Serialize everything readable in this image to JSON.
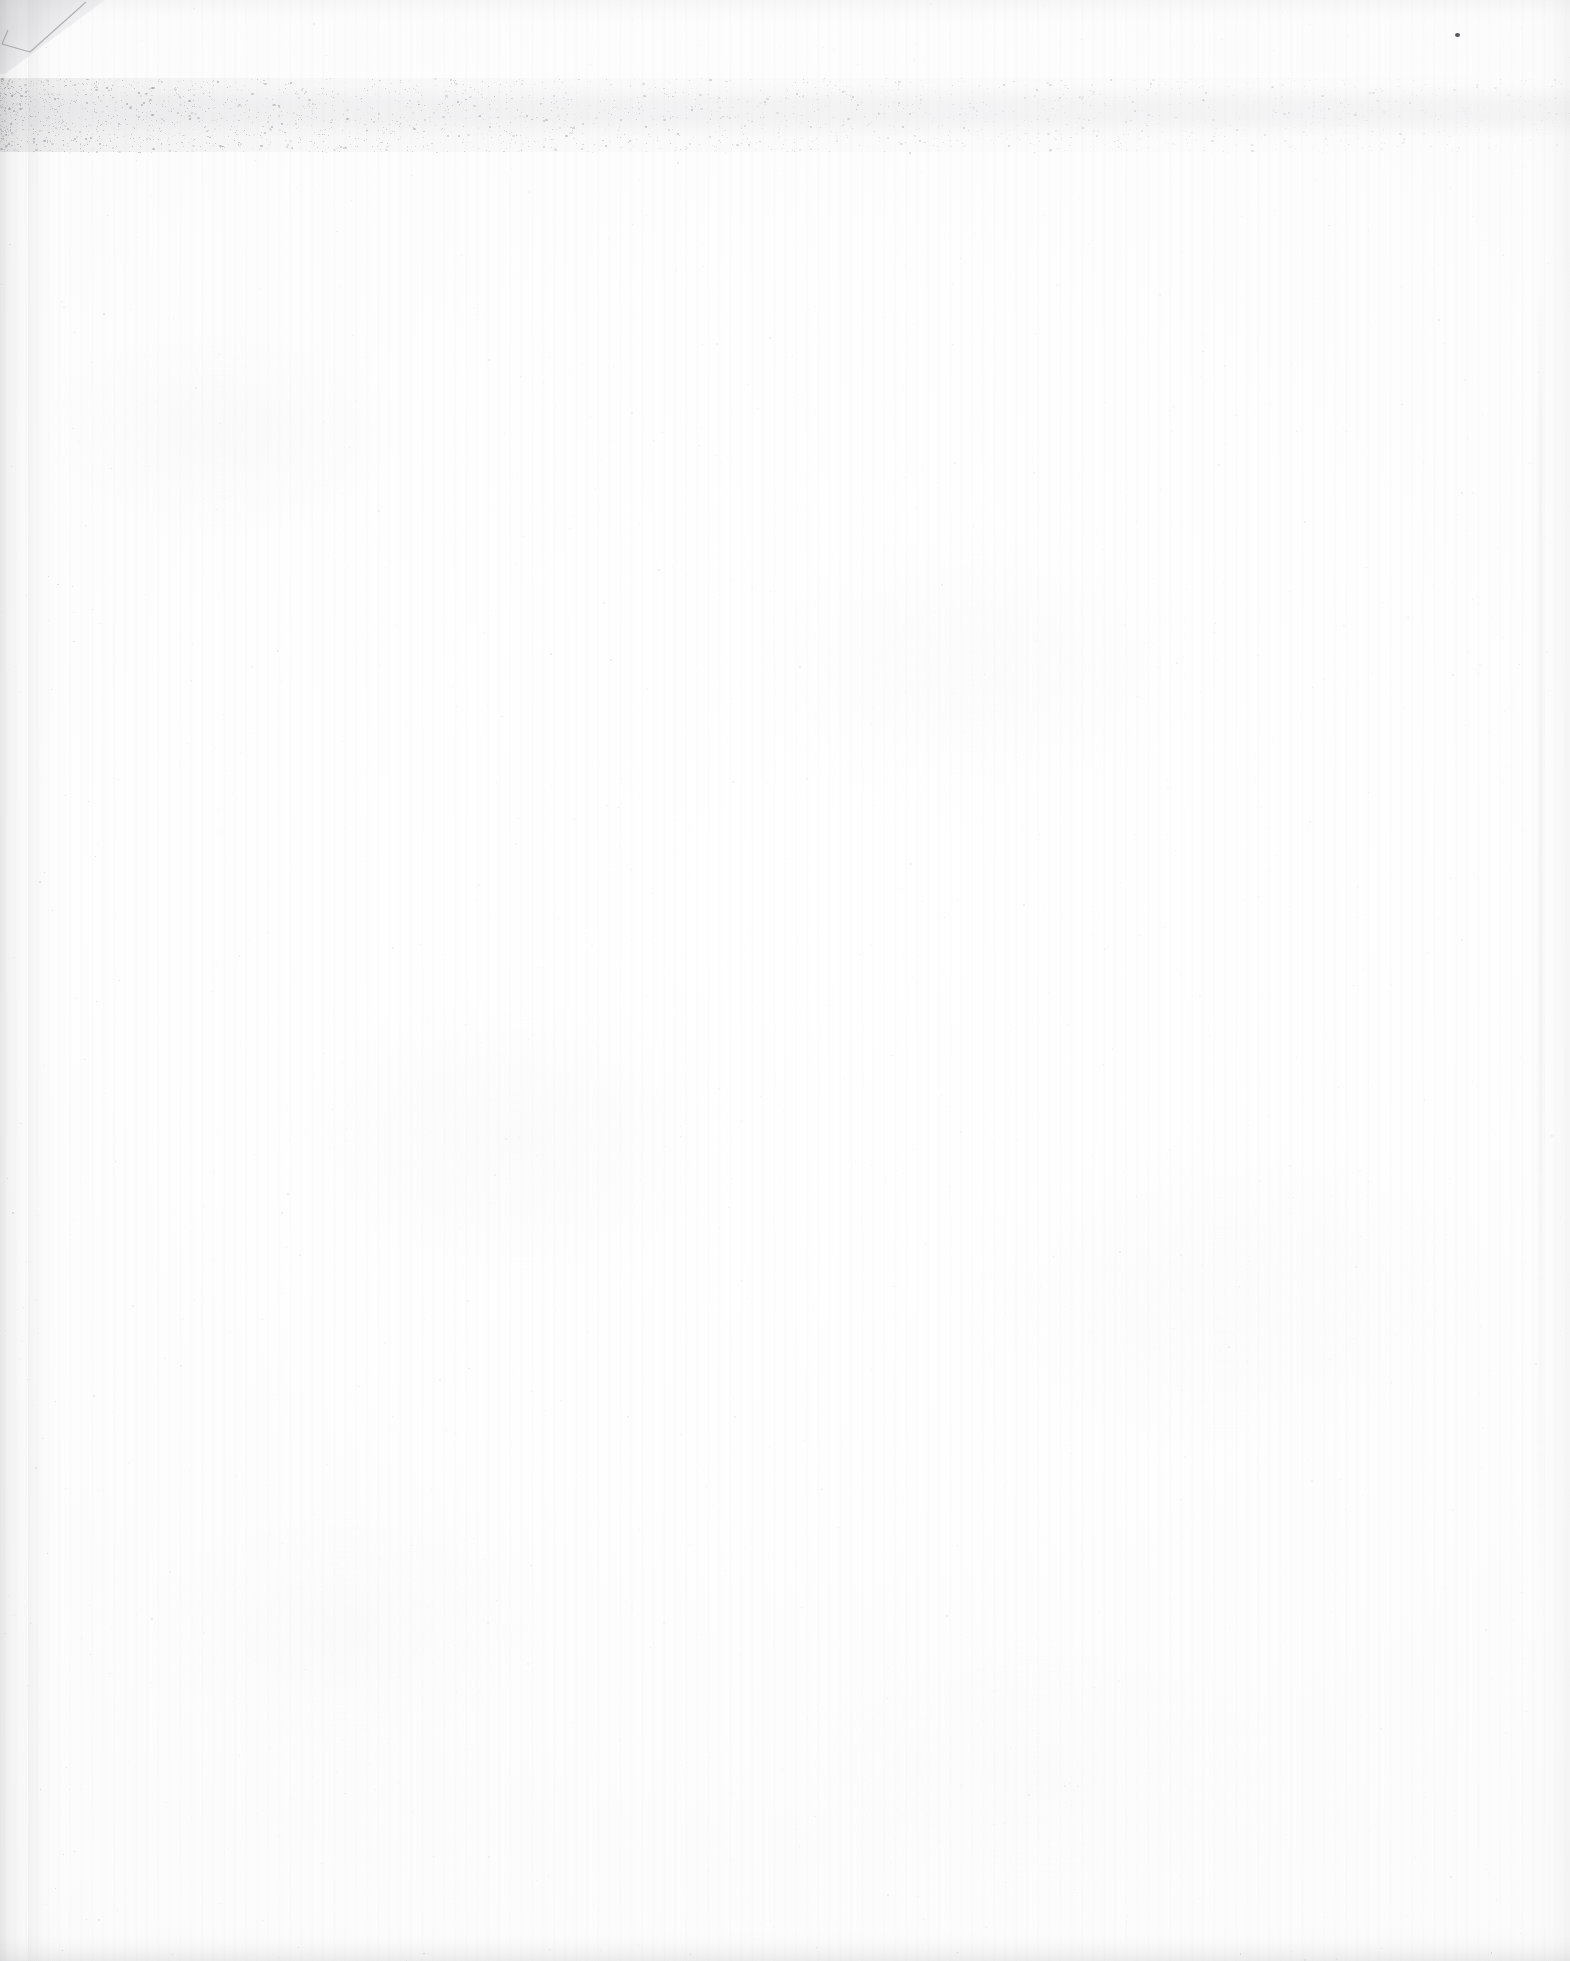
{
  "document": {
    "kind": "scanned-page",
    "content_state": "blank",
    "orientation": "portrait",
    "width_px": 1570,
    "height_px": 1961,
    "visible_text": "",
    "text_blocks": [],
    "figures": [],
    "page_number_shown": ""
  },
  "appearance": {
    "paper_color": "#fdfdfd",
    "paper_color_edge": "#f8f8f8",
    "background_color": "#ffffff",
    "speck_color": "#6e6e74",
    "dark_speck_color": "#55555c",
    "crease_color": "#787880",
    "shadow_color": "#96969a"
  },
  "artifacts": [
    {
      "name": "corner-fold",
      "label": "top-left dog-ear fold",
      "position": "top-left",
      "x": 0,
      "y": 0,
      "width": 108,
      "height": 74
    },
    {
      "name": "noise-band",
      "label": "horizontal scanner dust band",
      "position": "upper",
      "x": 0,
      "y": 78,
      "width": 1570,
      "height": 74
    },
    {
      "name": "left-edge-shadow",
      "label": "left edge scan shadow",
      "position": "left",
      "x": 0,
      "y": 0,
      "width": 46,
      "height": 1961
    },
    {
      "name": "right-edge-shadow",
      "label": "right edge scan shadow",
      "position": "right",
      "x": 1530,
      "y": 0,
      "width": 40,
      "height": 1961
    },
    {
      "name": "bottom-edge-shadow",
      "label": "bottom edge scan shadow",
      "position": "bottom",
      "x": 0,
      "y": 1927,
      "width": 1570,
      "height": 34
    },
    {
      "name": "dark-speck",
      "label": "isolated dark speck",
      "position": "top-right",
      "x": 1455,
      "y": 33,
      "width": 5,
      "height": 4
    }
  ]
}
